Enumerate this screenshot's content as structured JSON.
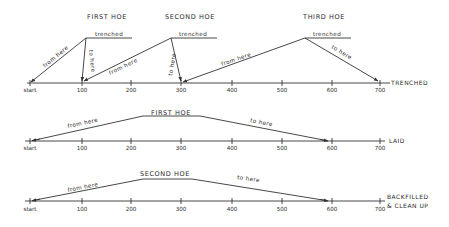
{
  "diagram": {
    "colors": {
      "ink": "#333333",
      "background": "#ffffff"
    },
    "tick_labels": [
      "start",
      "100",
      "200",
      "300",
      "400",
      "500",
      "600",
      "700"
    ],
    "tick_x": [
      30,
      82,
      131,
      181,
      232,
      282,
      332,
      380
    ],
    "rows": [
      {
        "id": "trenched",
        "axis_y": 83,
        "axis_x1": 27,
        "axis_x2": 390,
        "label_y": 92,
        "side_label": [
          "TRENCHED"
        ],
        "side_label_x": 391,
        "side_label_y": 83,
        "tick_count": 8
      },
      {
        "id": "laid",
        "axis_y": 141,
        "axis_x1": 25,
        "axis_x2": 385,
        "label_y": 150,
        "side_label": [
          "LAID"
        ],
        "side_label_x": 389,
        "side_label_y": 142,
        "tick_count": 8
      },
      {
        "id": "backfilled",
        "axis_y": 201,
        "axis_x1": 25,
        "axis_x2": 385,
        "label_y": 211,
        "side_label": [
          "BACKFILLED",
          "& CLEAN UP"
        ],
        "side_label_x": 387,
        "side_label_y": 198,
        "tick_count": 8
      }
    ],
    "hoes_row1": [
      {
        "title": "FIRST HOE",
        "title_x": 107,
        "title_y": 19,
        "trenched_label": "trenched",
        "trenched_x1": 86,
        "trenched_x2": 132,
        "trenched_y": 38,
        "apex": [
          86,
          38
        ],
        "from_end": [
          31,
          82
        ],
        "to_end": [
          82,
          81
        ],
        "from_label": "from here",
        "to_label": "to here"
      },
      {
        "title": "SECOND HOE",
        "title_x": 190,
        "title_y": 19,
        "trenched_label": "trenched",
        "trenched_x1": 171,
        "trenched_x2": 217,
        "trenched_y": 38,
        "apex": [
          171,
          38
        ],
        "from_end": [
          84,
          81
        ],
        "to_end": [
          181,
          81
        ],
        "from_label": "from here",
        "to_label": "to here"
      },
      {
        "title": "THIRD HOE",
        "title_x": 324,
        "title_y": 19,
        "trenched_label": "trenched",
        "trenched_x1": 305,
        "trenched_x2": 351,
        "trenched_y": 38,
        "apex": [
          305,
          38
        ],
        "from_end": [
          183,
          82
        ],
        "to_end": [
          378,
          81
        ],
        "from_label": "from here",
        "to_label": "to here"
      }
    ],
    "hoes_lower": [
      {
        "row": "laid",
        "title": "FIRST HOE",
        "title_x": 171,
        "title_y": 115,
        "points": [
          [
            31,
            141
          ],
          [
            143,
            116
          ],
          [
            200,
            116
          ],
          [
            328,
            141
          ]
        ],
        "from_label": "from here",
        "to_label": "to here"
      },
      {
        "row": "backfilled",
        "title": "SECOND HOE",
        "title_x": 165,
        "title_y": 176,
        "points": [
          [
            31,
            201
          ],
          [
            143,
            179
          ],
          [
            192,
            179
          ],
          [
            328,
            201
          ]
        ],
        "from_label": "from here",
        "to_label": "to here"
      }
    ]
  }
}
